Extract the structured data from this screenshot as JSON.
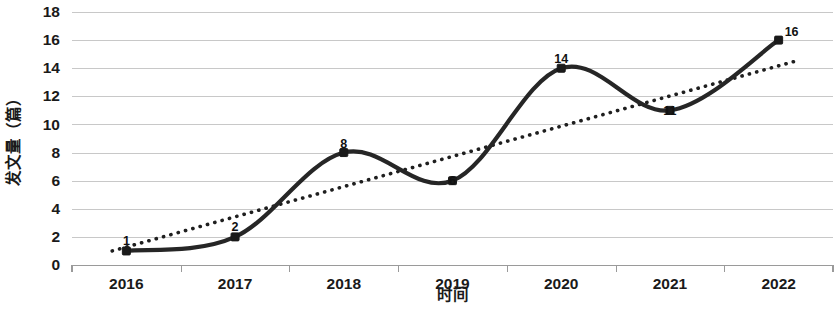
{
  "chart_data": {
    "type": "line",
    "title": "",
    "xlabel": "时间",
    "ylabel": "发文量（篇）",
    "categories": [
      "2016",
      "2017",
      "2018",
      "2019",
      "2020",
      "2021",
      "2022"
    ],
    "values": [
      1,
      2,
      8,
      6,
      14,
      11,
      16
    ],
    "point_labels": [
      "1",
      "2",
      "8",
      "6",
      "14",
      "11",
      "16"
    ],
    "series": [
      {
        "name": "发文量",
        "values": [
          1,
          2,
          8,
          6,
          14,
          11,
          16
        ],
        "style": "smooth-line-with-square-markers",
        "color": "#262626"
      },
      {
        "name": "趋势线",
        "style": "dotted-linear-trendline",
        "color": "#1f1f1f",
        "start_value": 1.0,
        "end_value": 14.6
      }
    ],
    "ylim": [
      0,
      18
    ],
    "ytick_step": 2,
    "ytick_labels": [
      "0",
      "2",
      "4",
      "6",
      "8",
      "10",
      "12",
      "14",
      "16",
      "18"
    ],
    "grid": true,
    "grid_axis": "y",
    "legend": "none",
    "legend_position": "none"
  },
  "axes": {
    "y_title": "发文量（篇）",
    "x_title": "时间"
  },
  "colors": {
    "series": "#262626",
    "trend": "#1f1f1f",
    "grid": "#c8c8c8",
    "axis": "#9a9a9a",
    "text": "#1a1a1a",
    "background": "#ffffff"
  }
}
